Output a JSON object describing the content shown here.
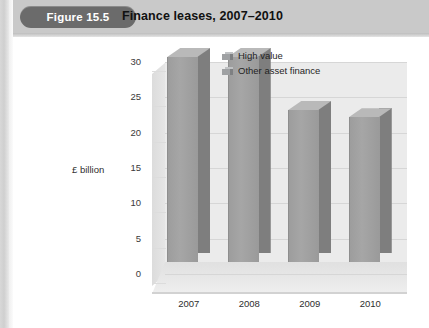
{
  "figure": {
    "badge_label": "Figure 15.5",
    "title": "Finance leases, 2007–2010"
  },
  "colors": {
    "header_band": "#c9c9c9",
    "badge_bg": "#6b6b6b",
    "badge_text": "#ffffff",
    "bar_front": "#a2a2a2",
    "bar_side": "#7e7e7e",
    "bar_top": "#b9b9b9",
    "plot_back_wall": "#ebebeb",
    "gridline": "#d6d6d6",
    "text": "#2e2e2e"
  },
  "chart_data": {
    "type": "bar",
    "title": "Finance leases, 2007–2010",
    "categories": [
      "2007",
      "2008",
      "2009",
      "2010"
    ],
    "series": [
      {
        "name": "High value",
        "values": [
          29,
          29,
          21.5,
          20.5
        ]
      }
    ],
    "legend": [
      "High value",
      "Other asset finance"
    ],
    "legend_position": "top-right",
    "xlabel": "",
    "ylabel": "£ billion",
    "ylim": [
      0,
      30
    ],
    "yticks": [
      "0",
      "5",
      "10",
      "15",
      "20",
      "25",
      "30"
    ],
    "ytick_values": [
      0,
      5,
      10,
      15,
      20,
      25,
      30
    ],
    "grid": true,
    "three_d": true
  }
}
